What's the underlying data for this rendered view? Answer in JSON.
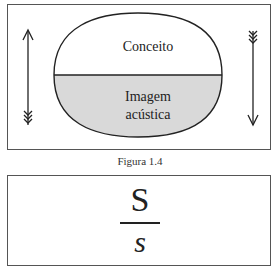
{
  "figure": {
    "top_label": "Conceito",
    "bottom_label_line1": "Imagem",
    "bottom_label_line2": "acústica",
    "caption": "Figura 1.4",
    "colors": {
      "fill_bottom": "#d9d9d9",
      "stroke": "#222222"
    },
    "arrows": [
      {
        "side": "left",
        "direction": "up"
      },
      {
        "side": "right",
        "direction": "down"
      }
    ]
  },
  "sign": {
    "signified": "S",
    "signifier": "s"
  }
}
